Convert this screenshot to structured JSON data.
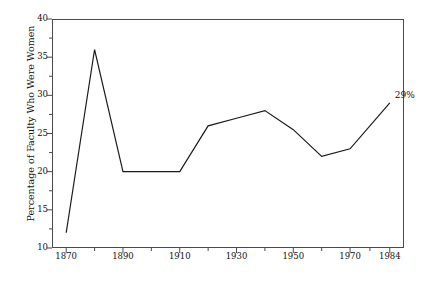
{
  "chart_data": {
    "type": "line",
    "title": "",
    "xlabel": "",
    "ylabel": "Percentage of Faculty Who Were Women",
    "x": [
      1870,
      1880,
      1890,
      1900,
      1910,
      1920,
      1930,
      1940,
      1950,
      1960,
      1970,
      1984
    ],
    "values": [
      12,
      36,
      20,
      20,
      20,
      26,
      27,
      28,
      25.5,
      22,
      23,
      29
    ],
    "series": [
      {
        "name": "Percentage of Faculty Who Were Women",
        "values": [
          12,
          36,
          20,
          20,
          20,
          26,
          27,
          28,
          25.5,
          22,
          23,
          29
        ]
      }
    ],
    "xlim": [
      1865,
      1989
    ],
    "ylim": [
      10,
      40
    ],
    "ytick_values": [
      40,
      35,
      30,
      25,
      20,
      15,
      10
    ],
    "ytick_labels": [
      "40",
      "35",
      "30",
      "25",
      "20",
      "15",
      "10"
    ],
    "yminor_values": [
      37.5,
      32.5,
      27.5,
      22.5,
      17.5,
      12.5
    ],
    "xtick_values": [
      1870,
      1890,
      1910,
      1930,
      1950,
      1970,
      1984
    ],
    "xtick_labels": [
      "1870",
      "1890",
      "1910",
      "1930",
      "1950",
      "1970",
      "1984"
    ],
    "xminor_values": [
      1880,
      1900,
      1920,
      1940,
      1960,
      1977
    ],
    "grid": false,
    "legend": "none",
    "line_color": "#1a1a1a",
    "frame_color": "#4a4a4a",
    "annotations": [
      {
        "text": "29%",
        "x": 1984,
        "y": 29
      }
    ]
  },
  "annotation": {
    "endpoint_label": "29%"
  }
}
